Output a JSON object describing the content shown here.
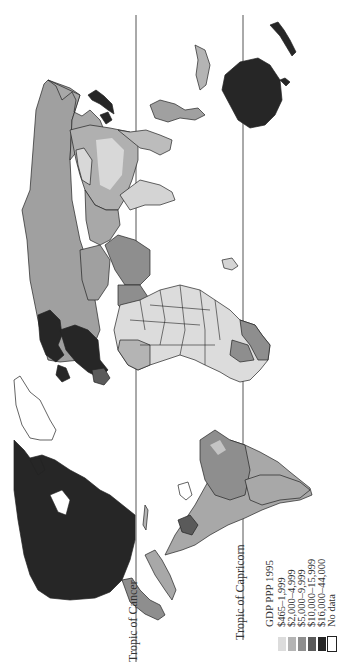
{
  "map": {
    "title": "GDP PPP 1995",
    "orientation": "rotated 90° counter-clockwise",
    "reference_lines": [
      {
        "label": "Tropic of Cancer",
        "x": 136
      },
      {
        "label": "Tropic of Capricorn",
        "x": 243
      }
    ],
    "legend": {
      "title": "GDP PPP 1995",
      "items": [
        {
          "label": "$465–1,999",
          "color": "#dcdcdc"
        },
        {
          "label": "$2,000–4,999",
          "color": "#b4b4b4"
        },
        {
          "label": "$5,000–9,999",
          "color": "#8e8e8e"
        },
        {
          "label": "$10,000–15,999",
          "color": "#5a5a5a"
        },
        {
          "label": "$16,000–44,000",
          "color": "#262626"
        },
        {
          "label": "No data",
          "color": "#ffffff"
        }
      ]
    },
    "colors": {
      "class1": "#dcdcdc",
      "class2": "#b4b4b4",
      "class3": "#8e8e8e",
      "class4": "#5a5a5a",
      "class5": "#262626",
      "nodata": "#ffffff"
    }
  }
}
